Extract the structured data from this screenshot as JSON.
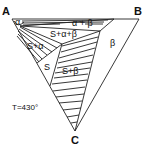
{
  "diagram": {
    "type": "ternary-phase-diagram-isothermal-section",
    "vertices": {
      "A": "A",
      "B": "B",
      "C": "C"
    },
    "temperature_label": "T=430°",
    "regions": {
      "alpha": "α",
      "alpha_beta": "α + β",
      "s_alpha_beta": "S+α+β",
      "s_alpha": "S+α",
      "s": "S",
      "s_beta": "S+β",
      "beta": "β"
    }
  }
}
